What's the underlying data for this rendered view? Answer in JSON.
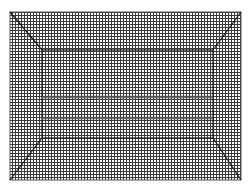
{
  "figure": {
    "type": "structured-mesh",
    "colors": {
      "background": "#ffffff",
      "grid_line": "#3a3a3a",
      "feature_line": "#1a1a1a"
    },
    "outer_box": {
      "x": 10,
      "y": 12,
      "w": 231,
      "h": 168
    },
    "inner_box": {
      "x": 42,
      "y": 50,
      "w": 171,
      "h": 88
    },
    "cell_size": 3,
    "horizontal_bands_y": [
      97,
      118
    ]
  }
}
